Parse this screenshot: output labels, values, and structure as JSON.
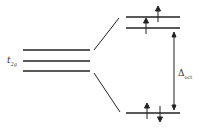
{
  "diagram": {
    "left_label": "t",
    "left_label_sub": "2g",
    "gap_label": "Δ",
    "gap_label_sub": "oct",
    "left_levels": 3,
    "right_upper_levels": 2,
    "right_lower_levels": 1,
    "electrons": {
      "upper_top": [
        "up"
      ],
      "upper_second": [
        "up"
      ],
      "lower": [
        "up",
        "down"
      ]
    },
    "line_color": "#222222"
  }
}
